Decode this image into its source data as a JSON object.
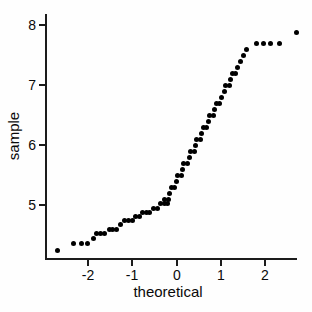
{
  "page": {
    "background_color": "#ffffff",
    "marker_color": "#000000",
    "axis_color": "#1c1c1c"
  },
  "chart_data": {
    "type": "scatter",
    "title": "",
    "xlabel": "theoretical",
    "ylabel": "sample",
    "legend": null,
    "grid": false,
    "xlim": [
      -2.95,
      2.85
    ],
    "ylim": [
      4.05,
      8.15
    ],
    "x_ticks": [
      -2,
      -1,
      0,
      1,
      2
    ],
    "y_ticks": [
      5,
      6,
      7,
      8
    ],
    "x_tick_labels": [
      "-2",
      "-1",
      "0",
      "1",
      "2"
    ],
    "y_tick_labels": [
      "5",
      "6",
      "7",
      "8"
    ],
    "marker": {
      "shape": "circle",
      "color": "#000000",
      "diameter_px": 5
    },
    "points": [
      [
        -2.7,
        4.25
      ],
      [
        -2.34,
        4.36
      ],
      [
        -2.16,
        4.36
      ],
      [
        -2.01,
        4.36
      ],
      [
        -1.89,
        4.45
      ],
      [
        -1.82,
        4.52
      ],
      [
        -1.73,
        4.52
      ],
      [
        -1.64,
        4.52
      ],
      [
        -1.53,
        4.6
      ],
      [
        -1.45,
        4.6
      ],
      [
        -1.37,
        4.6
      ],
      [
        -1.27,
        4.67
      ],
      [
        -1.17,
        4.74
      ],
      [
        -1.09,
        4.74
      ],
      [
        -1.01,
        4.74
      ],
      [
        -0.93,
        4.81
      ],
      [
        -0.85,
        4.81
      ],
      [
        -0.77,
        4.88
      ],
      [
        -0.69,
        4.88
      ],
      [
        -0.61,
        4.88
      ],
      [
        -0.52,
        4.95
      ],
      [
        -0.44,
        4.95
      ],
      [
        -0.36,
        5.02
      ],
      [
        -0.28,
        5.02
      ],
      [
        -0.2,
        5.02
      ],
      [
        -0.27,
        5.1
      ],
      [
        -0.19,
        5.1
      ],
      [
        -0.155,
        5.2
      ],
      [
        -0.125,
        5.3
      ],
      [
        -0.041,
        5.3
      ],
      [
        -0.01,
        5.4
      ],
      [
        0.02,
        5.5
      ],
      [
        0.104,
        5.5
      ],
      [
        0.135,
        5.6
      ],
      [
        0.165,
        5.7
      ],
      [
        0.249,
        5.7
      ],
      [
        0.28,
        5.8
      ],
      [
        0.31,
        5.9
      ],
      [
        0.394,
        5.9
      ],
      [
        0.425,
        6.0
      ],
      [
        0.455,
        6.1
      ],
      [
        0.539,
        6.1
      ],
      [
        0.57,
        6.2
      ],
      [
        0.6,
        6.3
      ],
      [
        0.684,
        6.3
      ],
      [
        0.714,
        6.4
      ],
      [
        0.745,
        6.5
      ],
      [
        0.829,
        6.5
      ],
      [
        0.859,
        6.6
      ],
      [
        0.89,
        6.7
      ],
      [
        0.974,
        6.7
      ],
      [
        1.004,
        6.8
      ],
      [
        1.077,
        6.9
      ],
      [
        1.107,
        7.0
      ],
      [
        1.191,
        7.0
      ],
      [
        1.222,
        7.1
      ],
      [
        1.252,
        7.2
      ],
      [
        1.336,
        7.2
      ],
      [
        1.367,
        7.3
      ],
      [
        1.439,
        7.4
      ],
      [
        1.512,
        7.5
      ],
      [
        1.584,
        7.6
      ],
      [
        1.8,
        7.7
      ],
      [
        1.97,
        7.7
      ],
      [
        2.13,
        7.7
      ],
      [
        2.32,
        7.7
      ],
      [
        2.71,
        7.87
      ]
    ],
    "pixel_mapping": {
      "x0_px": 176.7,
      "px_per_x_unit": 44.2,
      "y_top_px": 25,
      "px_per_y_unit": 60,
      "y_top_value": 8
    }
  }
}
